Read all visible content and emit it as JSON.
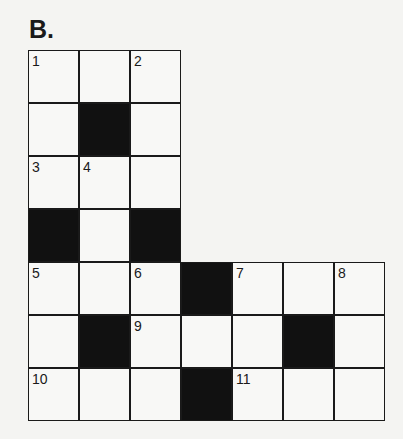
{
  "title": "B.",
  "grid": {
    "rows": 7,
    "cols": 7,
    "cells": [
      {
        "r": 0,
        "c": 0,
        "type": "white",
        "num": "1"
      },
      {
        "r": 0,
        "c": 1,
        "type": "white",
        "num": ""
      },
      {
        "r": 0,
        "c": 2,
        "type": "white",
        "num": "2"
      },
      {
        "r": 1,
        "c": 0,
        "type": "white",
        "num": ""
      },
      {
        "r": 1,
        "c": 1,
        "type": "black",
        "num": ""
      },
      {
        "r": 1,
        "c": 2,
        "type": "white",
        "num": ""
      },
      {
        "r": 2,
        "c": 0,
        "type": "white",
        "num": "3"
      },
      {
        "r": 2,
        "c": 1,
        "type": "white",
        "num": "4"
      },
      {
        "r": 2,
        "c": 2,
        "type": "white",
        "num": ""
      },
      {
        "r": 3,
        "c": 0,
        "type": "black",
        "num": ""
      },
      {
        "r": 3,
        "c": 1,
        "type": "white",
        "num": ""
      },
      {
        "r": 3,
        "c": 2,
        "type": "black",
        "num": ""
      },
      {
        "r": 4,
        "c": 0,
        "type": "white",
        "num": "5"
      },
      {
        "r": 4,
        "c": 1,
        "type": "white",
        "num": ""
      },
      {
        "r": 4,
        "c": 2,
        "type": "white",
        "num": "6"
      },
      {
        "r": 4,
        "c": 3,
        "type": "black",
        "num": ""
      },
      {
        "r": 4,
        "c": 4,
        "type": "white",
        "num": "7"
      },
      {
        "r": 4,
        "c": 5,
        "type": "white",
        "num": ""
      },
      {
        "r": 4,
        "c": 6,
        "type": "white",
        "num": "8"
      },
      {
        "r": 5,
        "c": 0,
        "type": "white",
        "num": ""
      },
      {
        "r": 5,
        "c": 1,
        "type": "black",
        "num": ""
      },
      {
        "r": 5,
        "c": 2,
        "type": "white",
        "num": "9"
      },
      {
        "r": 5,
        "c": 3,
        "type": "white",
        "num": ""
      },
      {
        "r": 5,
        "c": 4,
        "type": "white",
        "num": ""
      },
      {
        "r": 5,
        "c": 5,
        "type": "black",
        "num": ""
      },
      {
        "r": 5,
        "c": 6,
        "type": "white",
        "num": ""
      },
      {
        "r": 6,
        "c": 0,
        "type": "white",
        "num": "10"
      },
      {
        "r": 6,
        "c": 1,
        "type": "white",
        "num": ""
      },
      {
        "r": 6,
        "c": 2,
        "type": "white",
        "num": ""
      },
      {
        "r": 6,
        "c": 3,
        "type": "black",
        "num": ""
      },
      {
        "r": 6,
        "c": 4,
        "type": "white",
        "num": "11"
      },
      {
        "r": 6,
        "c": 5,
        "type": "white",
        "num": ""
      },
      {
        "r": 6,
        "c": 6,
        "type": "white",
        "num": ""
      }
    ]
  }
}
